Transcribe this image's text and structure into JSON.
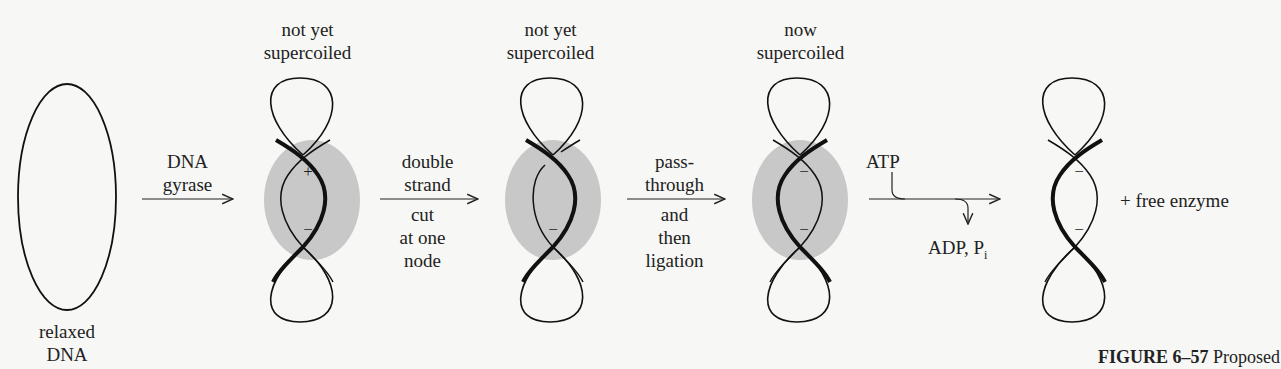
{
  "figure": {
    "caption_label": "FIGURE 6–57",
    "caption_text": "Proposed"
  },
  "states": [
    {
      "id": "relaxed",
      "label_line1": "relaxed",
      "label_line2": "DNA"
    },
    {
      "id": "bound",
      "label_line1": "not yet",
      "label_line2": "supercoiled",
      "node_signs": [
        "+",
        "−"
      ]
    },
    {
      "id": "cut",
      "label_line1": "not yet",
      "label_line2": "supercoiled",
      "node_signs": [
        "−"
      ]
    },
    {
      "id": "supercoiled",
      "label_line1": "now",
      "label_line2": "supercoiled",
      "node_signs": [
        "−",
        "−"
      ]
    },
    {
      "id": "released",
      "node_signs": [
        "−",
        "−"
      ],
      "suffix": "+ free enzyme"
    }
  ],
  "steps": [
    {
      "above": [
        "DNA",
        "gyrase"
      ],
      "below": []
    },
    {
      "above": [
        "double",
        "strand"
      ],
      "below": [
        "cut",
        "at one",
        "node"
      ]
    },
    {
      "above": [
        "pass-",
        "through"
      ],
      "below": [
        "and",
        "then",
        "ligation"
      ]
    },
    {
      "input": "ATP",
      "output": "ADP, P",
      "output_sub": "i"
    }
  ],
  "colors": {
    "enzyme_fill": "#c8c8c8",
    "stroke": "#111111",
    "background": "#f7f7f5"
  }
}
